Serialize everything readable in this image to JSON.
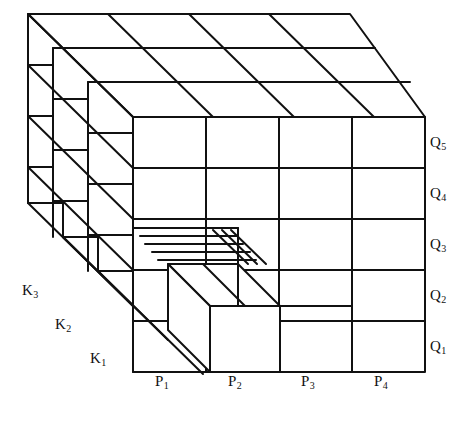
{
  "figure": {
    "type": "3d-block-diagram",
    "projection": "oblique",
    "stroke_color": "#111111",
    "fill_color": "#ffffff",
    "grid": {
      "front_columns": 4,
      "front_rows": 5,
      "depth_layers": 3
    }
  },
  "axes": {
    "horizontal": {
      "name": "P",
      "labels": [
        "P₁",
        "P₂",
        "P₃",
        "P₄"
      ],
      "position": "bottom"
    },
    "vertical": {
      "name": "Q",
      "labels": [
        "Q₁",
        "Q₂",
        "Q₃",
        "Q₄",
        "Q₅"
      ],
      "position": "right"
    },
    "depth": {
      "name": "K",
      "labels": [
        "K₁",
        "K₂",
        "K₃"
      ],
      "position": "left"
    }
  },
  "labels": {
    "p": [
      {
        "text": "P",
        "sub": "1",
        "x": 162,
        "y": 382
      },
      {
        "text": "P",
        "sub": "2",
        "x": 235,
        "y": 382
      },
      {
        "text": "P",
        "sub": "3",
        "x": 308,
        "y": 382
      },
      {
        "text": "P",
        "sub": "4",
        "x": 381,
        "y": 382
      }
    ],
    "q": [
      {
        "text": "Q",
        "sub": "1",
        "x": 432,
        "y": 341
      },
      {
        "text": "Q",
        "sub": "2",
        "x": 432,
        "y": 290
      },
      {
        "text": "Q",
        "sub": "3",
        "x": 432,
        "y": 239
      },
      {
        "text": "Q",
        "sub": "4",
        "x": 432,
        "y": 188
      },
      {
        "text": "Q",
        "sub": "5",
        "x": 432,
        "y": 137
      }
    ],
    "k": [
      {
        "text": "K",
        "sub": "1",
        "x": 92,
        "y": 359
      },
      {
        "text": "K",
        "sub": "2",
        "x": 57,
        "y": 325
      },
      {
        "text": "K",
        "sub": "3",
        "x": 24,
        "y": 291
      }
    ]
  }
}
